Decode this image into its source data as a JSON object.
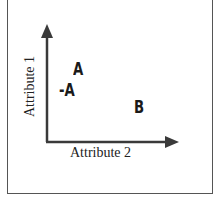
{
  "diagram": {
    "y_axis_label": "Attribute 1",
    "x_axis_label": "Attribute 2",
    "points": [
      {
        "label": "A"
      },
      {
        "label": "-A"
      },
      {
        "label": "B"
      }
    ],
    "colors": {
      "axis": "#3a3a3a",
      "text": "#1a1a1a",
      "frame": "#555555"
    }
  }
}
